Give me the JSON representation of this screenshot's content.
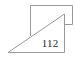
{
  "diagram": {
    "label": "112",
    "stroke_color": "#9a9a9a",
    "text_color": "#2a2a2a",
    "shapes": [
      {
        "type": "rectangle-partial",
        "name": "back-rectangle"
      },
      {
        "type": "right-triangle",
        "name": "front-triangle"
      }
    ]
  }
}
